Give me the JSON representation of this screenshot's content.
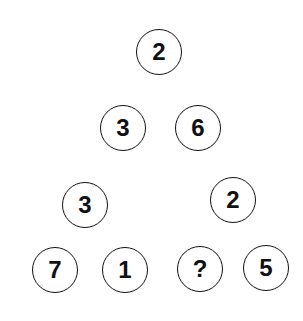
{
  "puzzle": {
    "description": "Triangle number puzzle with a missing value",
    "top": {
      "apex": "2",
      "left": "3",
      "right": "6"
    },
    "bottom_left": {
      "apex": "3",
      "left": "7",
      "right": "1"
    },
    "bottom_right": {
      "apex": "2",
      "left": "?",
      "right": "5"
    }
  },
  "colors": {
    "background": "#ffffff",
    "stroke": "#111111",
    "text": "#111111"
  }
}
